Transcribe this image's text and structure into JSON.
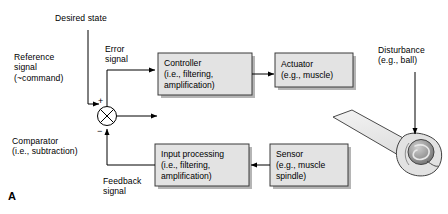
{
  "figure": {
    "panel_letter": "A",
    "background_color": "#ffffff",
    "box_fill_color": "#e3e3e3",
    "box_border_color": "#3a3a3a",
    "shadow_color": "#b5b5b5",
    "line_color": "#000000"
  },
  "labels": {
    "desired_state": "Desired state",
    "reference_signal": "Reference\nsignal\n(~command)",
    "error_signal": "Error\nsignal",
    "comparator": "Comparator\n(i.e., subtraction)",
    "feedback_signal": "Feedback\nsignal",
    "disturbance": "Disturbance\n(e.g., ball)"
  },
  "comparator": {
    "plus_sign": "+",
    "minus_sign": "−",
    "glyph": "circle-with-cross"
  },
  "blocks": [
    {
      "id": "controller",
      "title": "Controller",
      "detail_line_1": "(i.e., filtering,",
      "detail_line_2": "amplification)"
    },
    {
      "id": "actuator",
      "title": "Actuator",
      "detail_line_1": "(e.g., muscle)",
      "detail_line_2": ""
    },
    {
      "id": "input-processing",
      "title": "Input processing",
      "detail_line_1": "(i.e., filtering,",
      "detail_line_2": "amplification)"
    },
    {
      "id": "sensor",
      "title": "Sensor",
      "detail_line_1": "(e.g., muscle",
      "detail_line_2": "spindle)"
    }
  ],
  "illustration": {
    "name": "arm-hand-holding-ball",
    "arm_fill": "#ececec",
    "hand_fill": "#e0e0e0",
    "ball_fill": "#8f8f8f"
  }
}
